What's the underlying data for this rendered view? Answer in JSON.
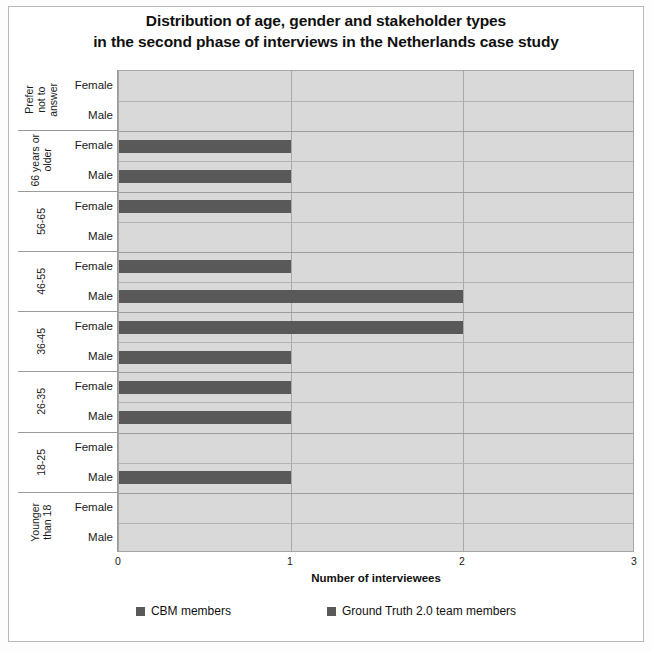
{
  "title": {
    "line1": "Distribution of age, gender and stakeholder types",
    "line2": "in the second phase of interviews in the Netherlands case study"
  },
  "axis": {
    "x_title": "Number of interviewees",
    "x_ticks": [
      "0",
      "1",
      "2",
      "3"
    ],
    "gender_female": "Female",
    "gender_male": "Male"
  },
  "legend": {
    "items": [
      {
        "label": "CBM members",
        "color": "#595959"
      },
      {
        "label": "Ground Truth 2.0 team members",
        "color": "#595959"
      }
    ]
  },
  "colors": {
    "bar": "#595959",
    "plot_background": "#d9d9d9",
    "gridline": "#b4b4b4",
    "page_background": "#ffffff"
  },
  "chart_data": {
    "type": "bar",
    "orientation": "horizontal",
    "title": "Distribution of age, gender and stakeholder types in the second phase of interviews in the Netherlands case study",
    "xlabel": "Number of interviewees",
    "ylabel": "",
    "xlim": [
      0,
      3
    ],
    "xticks": [
      0,
      1,
      2,
      3
    ],
    "grid": true,
    "legend_position": "bottom",
    "categories": [
      "Prefer not to answer",
      "66 years or older",
      "56-65",
      "46-55",
      "36-45",
      "26-35",
      "18-25",
      "Younger than 18"
    ],
    "category_labels_display": [
      "Prefer\nnot to\nanswer",
      "66 years or\nolder",
      "56-65",
      "46-55",
      "36-45",
      "26-35",
      "18-25",
      "Younger\nthan 18"
    ],
    "subcategories": [
      "Female",
      "Male"
    ],
    "series": [
      {
        "name": "CBM members",
        "values_female": [
          0,
          1,
          1,
          1,
          2,
          1,
          0,
          0
        ],
        "values_male": [
          0,
          1,
          0,
          2,
          1,
          1,
          1,
          0
        ]
      }
    ],
    "rows": [
      {
        "age": "Prefer not to answer",
        "gender": "Female",
        "value": 0
      },
      {
        "age": "Prefer not to answer",
        "gender": "Male",
        "value": 0
      },
      {
        "age": "66 years or older",
        "gender": "Female",
        "value": 1
      },
      {
        "age": "66 years or older",
        "gender": "Male",
        "value": 1
      },
      {
        "age": "56-65",
        "gender": "Female",
        "value": 1
      },
      {
        "age": "56-65",
        "gender": "Male",
        "value": 0
      },
      {
        "age": "46-55",
        "gender": "Female",
        "value": 1
      },
      {
        "age": "46-55",
        "gender": "Male",
        "value": 2
      },
      {
        "age": "36-45",
        "gender": "Female",
        "value": 2
      },
      {
        "age": "36-45",
        "gender": "Male",
        "value": 1
      },
      {
        "age": "26-35",
        "gender": "Female",
        "value": 1
      },
      {
        "age": "26-35",
        "gender": "Male",
        "value": 1
      },
      {
        "age": "18-25",
        "gender": "Female",
        "value": 0
      },
      {
        "age": "18-25",
        "gender": "Male",
        "value": 1
      },
      {
        "age": "Younger than 18",
        "gender": "Female",
        "value": 0
      },
      {
        "age": "Younger than 18",
        "gender": "Male",
        "value": 0
      }
    ]
  }
}
